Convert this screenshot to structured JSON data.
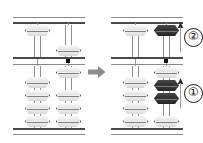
{
  "figure": {
    "type": "soroban-abacus-operation-diagram",
    "transition_arrow": "right-arrow",
    "colors": {
      "bead_light": "#ececec",
      "bead_dark": "#2e2e2e",
      "frame": "#4a4a4a",
      "rod": "#9a9a9a",
      "arrow": "#8c8c8c",
      "unit_dot": "#111111"
    }
  },
  "abacus_before": {
    "label": "before",
    "rods": [
      {
        "name": "tens-rod",
        "heaven_bead": {
          "state": "up",
          "shade": "light"
        },
        "earth_beads": [
          {
            "state": "down",
            "shade": "light"
          },
          {
            "state": "down",
            "shade": "light"
          },
          {
            "state": "down",
            "shade": "light"
          },
          {
            "state": "down",
            "shade": "light"
          }
        ]
      },
      {
        "name": "units-rod",
        "heaven_bead": {
          "state": "down",
          "shade": "light"
        },
        "earth_beads": [
          {
            "state": "up",
            "shade": "light"
          },
          {
            "state": "down",
            "shade": "light"
          },
          {
            "state": "down",
            "shade": "light"
          },
          {
            "state": "down",
            "shade": "light"
          }
        ]
      }
    ],
    "unit_dot": true
  },
  "abacus_after": {
    "label": "after",
    "rods": [
      {
        "name": "tens-rod",
        "heaven_bead": {
          "state": "up",
          "shade": "light"
        },
        "earth_beads": [
          {
            "state": "down",
            "shade": "light"
          },
          {
            "state": "down",
            "shade": "light"
          },
          {
            "state": "down",
            "shade": "light"
          },
          {
            "state": "down",
            "shade": "light"
          }
        ]
      },
      {
        "name": "units-rod",
        "heaven_bead": {
          "state": "up",
          "shade": "dark"
        },
        "earth_beads": [
          {
            "state": "up",
            "shade": "light"
          },
          {
            "state": "up",
            "shade": "dark"
          },
          {
            "state": "up",
            "shade": "dark"
          },
          {
            "state": "down",
            "shade": "light"
          }
        ]
      }
    ],
    "unit_dot": true
  },
  "step_markers": [
    {
      "id": "marker-2",
      "label": "②",
      "number": "2",
      "direction": "up",
      "region": "heaven"
    },
    {
      "id": "marker-1",
      "label": "①",
      "number": "1",
      "direction": "up",
      "region": "earth"
    }
  ]
}
